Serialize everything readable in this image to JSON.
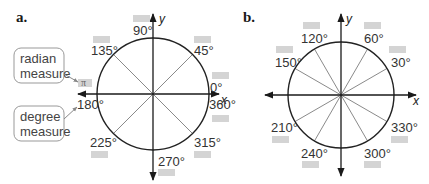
{
  "colors": {
    "axis": "#1a1a1a",
    "circle": "#222222",
    "spoke": "#8a8a8a",
    "blank_box": "#d4d4d4",
    "callout_border": "#999999",
    "label_text": "#333333"
  },
  "diagram_a": {
    "label": "a.",
    "x_axis": "x",
    "y_axis": "y",
    "angles": [
      {
        "deg": 0,
        "text": "0°"
      },
      {
        "deg": 45,
        "text": "45°"
      },
      {
        "deg": 90,
        "text": "90°"
      },
      {
        "deg": 135,
        "text": "135°"
      },
      {
        "deg": 180,
        "text": "180°",
        "radian": "π"
      },
      {
        "deg": 225,
        "text": "225°"
      },
      {
        "deg": 270,
        "text": "270°"
      },
      {
        "deg": 315,
        "text": "315°"
      },
      {
        "deg": 360,
        "text": "360°"
      }
    ],
    "callouts": {
      "radian": [
        "radian",
        "measure"
      ],
      "degree": [
        "degree",
        "measure"
      ]
    },
    "radian_180": "π"
  },
  "diagram_b": {
    "label": "b.",
    "x_axis": "x",
    "y_axis": "y",
    "angles": [
      {
        "deg": 30,
        "text": "30°"
      },
      {
        "deg": 60,
        "text": "60°"
      },
      {
        "deg": 120,
        "text": "120°"
      },
      {
        "deg": 150,
        "text": "150°"
      },
      {
        "deg": 210,
        "text": "210°"
      },
      {
        "deg": 240,
        "text": "240°"
      },
      {
        "deg": 300,
        "text": "300°"
      },
      {
        "deg": 330,
        "text": "330°"
      }
    ]
  }
}
